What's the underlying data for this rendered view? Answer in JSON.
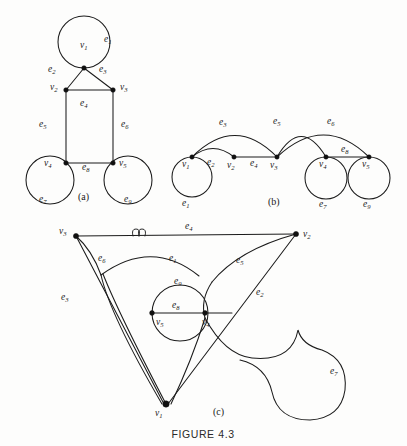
{
  "figure": {
    "caption": "FIGURE 4.3",
    "panels": [
      {
        "id": "a",
        "label": "(a)"
      },
      {
        "id": "b",
        "label": "(b)"
      },
      {
        "id": "c",
        "label": "(c)"
      }
    ],
    "vertex_names": [
      "v",
      "1",
      "2",
      "3",
      "4",
      "5"
    ],
    "edge_names": [
      "e",
      "1",
      "2",
      "3",
      "4",
      "5",
      "6",
      "7",
      "8",
      "9"
    ]
  },
  "graph": {
    "description": "Three isomorphic drawings of the same multigraph with five vertices and nine edges",
    "vertices": [
      "v1",
      "v2",
      "v3",
      "v4",
      "v5"
    ],
    "edges": [
      {
        "id": "e1",
        "from": "v1",
        "to": "v1",
        "type": "loop"
      },
      {
        "id": "e2",
        "from": "v1",
        "to": "v2",
        "type": "link"
      },
      {
        "id": "e3",
        "from": "v1",
        "to": "v3",
        "type": "link"
      },
      {
        "id": "e4",
        "from": "v2",
        "to": "v3",
        "type": "link"
      },
      {
        "id": "e5",
        "from": "v3",
        "to": "v4",
        "type": "link"
      },
      {
        "id": "e6",
        "from": "v3",
        "to": "v5",
        "type": "link"
      },
      {
        "id": "e7",
        "from": "v4",
        "to": "v4",
        "type": "loop"
      },
      {
        "id": "e8",
        "from": "v4",
        "to": "v5",
        "type": "link"
      },
      {
        "id": "e9",
        "from": "v5",
        "to": "v5",
        "type": "loop"
      }
    ]
  },
  "panel_a": {
    "label": "(a)",
    "vertex_labels": [
      {
        "name": "v1",
        "base": "v",
        "sub": "1",
        "x": 80,
        "y": 48
      },
      {
        "name": "v2",
        "base": "v",
        "sub": "2",
        "x": 57,
        "y": 90
      },
      {
        "name": "v3",
        "base": "v",
        "sub": "3",
        "x": 120,
        "y": 90
      },
      {
        "name": "v4",
        "base": "v",
        "sub": "4",
        "x": 47,
        "y": 166
      },
      {
        "name": "v5",
        "base": "v",
        "sub": "5",
        "x": 120,
        "y": 166
      }
    ],
    "edge_labels": [
      {
        "name": "e1",
        "base": "e",
        "sub": "1",
        "x": 104,
        "y": 42
      },
      {
        "name": "e2",
        "base": "e",
        "sub": "2",
        "x": 50,
        "y": 72
      },
      {
        "name": "e3",
        "base": "e",
        "sub": "3",
        "x": 101,
        "y": 72
      },
      {
        "name": "e4",
        "base": "e",
        "sub": "4",
        "x": 82,
        "y": 106
      },
      {
        "name": "e5",
        "base": "e",
        "sub": "5",
        "x": 41,
        "y": 127
      },
      {
        "name": "e6",
        "base": "e",
        "sub": "6",
        "x": 123,
        "y": 127
      },
      {
        "name": "e7",
        "base": "e",
        "sub": "7",
        "x": 41,
        "y": 202
      },
      {
        "name": "e8",
        "base": "e",
        "sub": "8",
        "x": 84,
        "y": 170
      },
      {
        "name": "e9",
        "base": "e",
        "sub": "9",
        "x": 126,
        "y": 202
      }
    ]
  },
  "panel_b": {
    "label": "(b)",
    "vertex_labels": [
      {
        "name": "v1",
        "base": "v",
        "sub": "1",
        "x": 184,
        "y": 162
      },
      {
        "name": "v2",
        "base": "v",
        "sub": "2",
        "x": 230,
        "y": 163
      },
      {
        "name": "v3",
        "base": "v",
        "sub": "3",
        "x": 273,
        "y": 163
      },
      {
        "name": "v4",
        "base": "v",
        "sub": "4",
        "x": 322,
        "y": 162
      },
      {
        "name": "v5",
        "base": "v",
        "sub": "5",
        "x": 366,
        "y": 162
      }
    ],
    "edge_labels": [
      {
        "name": "e1",
        "base": "e",
        "sub": "1",
        "x": 185,
        "y": 203
      },
      {
        "name": "e2",
        "base": "e",
        "sub": "2",
        "x": 210,
        "y": 160
      },
      {
        "name": "e3",
        "base": "e",
        "sub": "3",
        "x": 222,
        "y": 122
      },
      {
        "name": "e4",
        "base": "e",
        "sub": "4",
        "x": 253,
        "y": 161
      },
      {
        "name": "e5",
        "base": "e",
        "sub": "5",
        "x": 276,
        "y": 121
      },
      {
        "name": "e6",
        "base": "e",
        "sub": "6",
        "x": 330,
        "y": 121
      },
      {
        "name": "e7",
        "base": "e",
        "sub": "7",
        "x": 322,
        "y": 204
      },
      {
        "name": "e8",
        "base": "e",
        "sub": "8",
        "x": 344,
        "y": 154
      },
      {
        "name": "e9",
        "base": "e",
        "sub": "9",
        "x": 366,
        "y": 204
      }
    ]
  },
  "panel_c": {
    "label": "(c)",
    "vertex_labels": [
      {
        "name": "v3",
        "base": "v",
        "sub": "3",
        "x": 62,
        "y": 233
      },
      {
        "name": "v2",
        "base": "v",
        "sub": "2",
        "x": 306,
        "y": 237
      },
      {
        "name": "v1",
        "base": "v",
        "sub": "1",
        "x": 155,
        "y": 411
      },
      {
        "name": "v5",
        "base": "v",
        "sub": "5",
        "x": 161,
        "y": 321
      },
      {
        "name": "v4",
        "base": "v",
        "sub": "4",
        "x": 204,
        "y": 320
      }
    ],
    "edge_labels": [
      {
        "name": "e4",
        "base": "e",
        "sub": "4",
        "x": 188,
        "y": 227
      },
      {
        "name": "e6",
        "base": "e",
        "sub": "6",
        "x": 101,
        "y": 258
      },
      {
        "name": "e1",
        "base": "e",
        "sub": "1",
        "x": 172,
        "y": 258
      },
      {
        "name": "e5",
        "base": "e",
        "sub": "5",
        "x": 238,
        "y": 260
      },
      {
        "name": "e3",
        "base": "e",
        "sub": "3",
        "x": 64,
        "y": 297
      },
      {
        "name": "e9",
        "base": "e",
        "sub": "9",
        "x": 177,
        "y": 281
      },
      {
        "name": "e8",
        "base": "e",
        "sub": "8",
        "x": 175,
        "y": 305
      },
      {
        "name": "e2",
        "base": "e",
        "sub": "2",
        "x": 259,
        "y": 292
      },
      {
        "name": "e7",
        "base": "e",
        "sub": "7",
        "x": 332,
        "y": 371
      }
    ]
  }
}
